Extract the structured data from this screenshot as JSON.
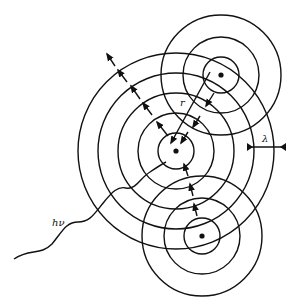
{
  "diagram": {
    "labels": {
      "photon": "hν",
      "distance": "r",
      "wavelength": "λ"
    },
    "colors": {
      "ink": "#111111",
      "background": "#ffffff"
    },
    "atoms": [
      {
        "id": "absorber",
        "cx": 176,
        "cy": 151,
        "radii": [
          18,
          38,
          58,
          78,
          98
        ]
      },
      {
        "id": "scatterer-top",
        "cx": 221,
        "cy": 75,
        "radii": [
          18,
          38,
          60
        ]
      },
      {
        "id": "scatterer-bottom",
        "cx": 202,
        "cy": 236,
        "radii": [
          18,
          38,
          60
        ]
      }
    ]
  }
}
